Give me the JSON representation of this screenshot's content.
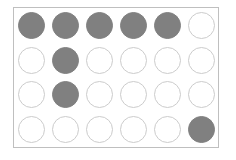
{
  "panel": {
    "name": "circle-grid-panel",
    "border_color": "#bfbfbf",
    "background_color": "#ffffff"
  },
  "legend": {
    "filled_color": "#808080",
    "empty_fill_color": "#ffffff",
    "empty_stroke_color": "#cccccc"
  },
  "grid": {
    "columns": 6,
    "rows": 4,
    "cells": [
      [
        {
          "state": "filled"
        },
        {
          "state": "filled"
        },
        {
          "state": "filled"
        },
        {
          "state": "filled"
        },
        {
          "state": "filled"
        },
        {
          "state": "empty"
        }
      ],
      [
        {
          "state": "empty"
        },
        {
          "state": "filled"
        },
        {
          "state": "empty"
        },
        {
          "state": "empty"
        },
        {
          "state": "empty"
        },
        {
          "state": "empty"
        }
      ],
      [
        {
          "state": "empty"
        },
        {
          "state": "filled"
        },
        {
          "state": "empty"
        },
        {
          "state": "empty"
        },
        {
          "state": "empty"
        },
        {
          "state": "empty"
        }
      ],
      [
        {
          "state": "empty"
        },
        {
          "state": "empty"
        },
        {
          "state": "empty"
        },
        {
          "state": "empty"
        },
        {
          "state": "empty"
        },
        {
          "state": "filled"
        }
      ]
    ]
  }
}
